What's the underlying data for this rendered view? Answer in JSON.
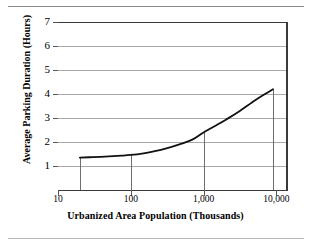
{
  "chart_data": {
    "type": "line",
    "title": "",
    "xlabel": "Urbanized Area Population (Thousands)",
    "ylabel": "Average Parking Duration (Hours)",
    "xscale": "log",
    "xlim": [
      10,
      14000
    ],
    "ylim": [
      0,
      7
    ],
    "grid": true,
    "legend": "none",
    "x_ticks": [
      {
        "value": 10,
        "label": "10"
      },
      {
        "value": 100,
        "label": "100"
      },
      {
        "value": 1000,
        "label": "1,000"
      },
      {
        "value": 10000,
        "label": "10,000"
      }
    ],
    "y_ticks": [
      {
        "value": 7,
        "label": "7"
      },
      {
        "value": 6,
        "label": "6"
      },
      {
        "value": 5,
        "label": "5"
      },
      {
        "value": 4,
        "label": "4"
      },
      {
        "value": 3,
        "label": "3"
      },
      {
        "value": 2,
        "label": "2"
      },
      {
        "value": 1,
        "label": "1"
      }
    ],
    "series": [
      {
        "name": "Average parking duration",
        "x": [
          20,
          30,
          50,
          75,
          100,
          150,
          200,
          300,
          500,
          700,
          1000,
          1500,
          2000,
          3000,
          5000,
          7000,
          9000
        ],
        "values": [
          1.35,
          1.37,
          1.4,
          1.43,
          1.46,
          1.53,
          1.6,
          1.72,
          1.93,
          2.1,
          2.4,
          2.7,
          2.92,
          3.25,
          3.72,
          4.0,
          4.2
        ]
      }
    ],
    "drop_lines": [
      {
        "x": 20,
        "y": 1.35
      },
      {
        "x": 100,
        "y": 1.46
      },
      {
        "x": 1000,
        "y": 2.4
      },
      {
        "x": 9000,
        "y": 4.2
      }
    ],
    "annotations": [],
    "colors": {
      "curve": "#111111",
      "grid": "#a9a9a9",
      "axis": "#3a3a3a",
      "background": "#ffffff"
    }
  }
}
